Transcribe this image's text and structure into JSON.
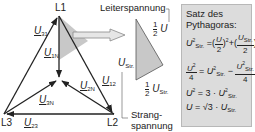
{
  "diagram": {
    "nodes": {
      "l1": "L1",
      "l2": "L2",
      "l3": "L3"
    },
    "vectors": {
      "u31": {
        "symbol": "U",
        "sub": "31"
      },
      "u1n": {
        "symbol": "U",
        "sub": "1N"
      },
      "u12": {
        "symbol": "U",
        "sub": "12"
      },
      "u2n": {
        "symbol": "U",
        "sub": "2N"
      },
      "u3n": {
        "symbol": "U",
        "sub": "3N"
      },
      "u23": {
        "symbol": "U",
        "sub": "23"
      }
    },
    "detail": {
      "leiterspannung": "Leiterspannung",
      "half_u_num": "1",
      "half_u_den": "2",
      "half_u_sym": "U",
      "u_str_sym": "U",
      "u_str_sub": "Str.",
      "half_ustr_num": "1",
      "half_ustr_den": "2",
      "half_ustr_sym": "U",
      "half_ustr_sub": "Str.",
      "strangspannung_1": "Strang-",
      "strangspannung_2": "spannung"
    },
    "colors": {
      "line": "#222222",
      "fill": "#c8c8c8",
      "box_bg": "#dcdcdc",
      "arrow_fill": "#e0e0e0"
    }
  },
  "formula_box": {
    "title_1": "Satz des",
    "title_2": "Pythagoras:",
    "eq1": {
      "lhs": "U",
      "lhs_sub": "Str.",
      "lhs_sup": "2",
      "eq": "=",
      "t1_num": "U",
      "t1_den": "2",
      "t1_sup": "2",
      "plus": "+",
      "t2_num": "U",
      "t2_num_sub": "Str.",
      "t2_den": "2",
      "t2_sup": "2"
    },
    "eq2": {
      "lhs_num": "U",
      "lhs_sup": "2",
      "lhs_den": "4",
      "eq": "=",
      "r1": "U",
      "r1_sub": "Str.",
      "r1_sup": "2",
      "minus": "−",
      "r2_num": "U",
      "r2_sub": "Str.",
      "r2_sup": "2",
      "r2_den": "4"
    },
    "eq3": {
      "lhs": "U",
      "lhs_sup": "2",
      "eq": "=",
      "rhs": "3 ·",
      "r": "U",
      "r_sub": "Str.",
      "r_sup": "2"
    },
    "eq4": {
      "lhs": "U",
      "eq": "=",
      "root": "√3",
      "dot": "·",
      "r": "U",
      "r_sub": "Str."
    }
  }
}
